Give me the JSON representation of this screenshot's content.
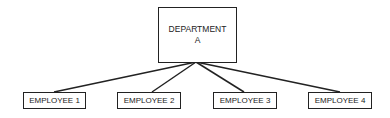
{
  "diagram": {
    "type": "org-chart",
    "root": {
      "label_line1": "DEPARTMENT",
      "label_line2": "A"
    },
    "children": [
      {
        "label": "EMPLOYEE 1"
      },
      {
        "label": "EMPLOYEE 2"
      },
      {
        "label": "EMPLOYEE 3"
      },
      {
        "label": "EMPLOYEE 4"
      }
    ],
    "colors": {
      "stroke": "#222222",
      "background": "#ffffff"
    }
  }
}
